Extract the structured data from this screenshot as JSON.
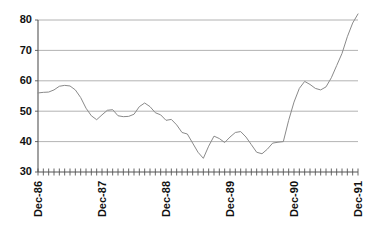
{
  "chart_data": {
    "type": "line",
    "title": "",
    "subtitle": "",
    "xlabel": "",
    "ylabel": "",
    "ylim": [
      30,
      80
    ],
    "xlim": [
      "Dec-86",
      "Dec-91"
    ],
    "grid": true,
    "legend": false,
    "legend_position": "none",
    "y_ticks": [
      30,
      40,
      50,
      60,
      70,
      80
    ],
    "y_tick_labels": [
      "30",
      "40",
      "50",
      "60",
      "70",
      "80"
    ],
    "x_tick_labels": [
      "Dec-86",
      "Dec-87",
      "Dec-88",
      "Dec-89",
      "Dec-90",
      "Dec-91"
    ],
    "x_tick_positions": [
      0,
      12,
      24,
      36,
      48,
      60
    ],
    "x_minor_tick_count": 61,
    "line_color": "#8a8a8a",
    "grid_color": "#a0a0a0",
    "axis_color": "#555555",
    "background_color": "#ffffff",
    "x": [
      "Dec-86",
      "Jan-87",
      "Feb-87",
      "Mar-87",
      "Apr-87",
      "May-87",
      "Jun-87",
      "Jul-87",
      "Aug-87",
      "Sep-87",
      "Oct-87",
      "Nov-87",
      "Dec-87",
      "Jan-88",
      "Feb-88",
      "Mar-88",
      "Apr-88",
      "May-88",
      "Jun-88",
      "Jul-88",
      "Aug-88",
      "Sep-88",
      "Oct-88",
      "Nov-88",
      "Dec-88",
      "Jan-89",
      "Feb-89",
      "Mar-89",
      "Apr-89",
      "May-89",
      "Jun-89",
      "Jul-89",
      "Aug-89",
      "Sep-89",
      "Oct-89",
      "Nov-89",
      "Dec-89",
      "Jan-90",
      "Feb-90",
      "Mar-90",
      "Apr-90",
      "May-90",
      "Jun-90",
      "Jul-90",
      "Aug-90",
      "Sep-90",
      "Oct-90",
      "Nov-90",
      "Dec-90",
      "Jan-91",
      "Feb-91",
      "Mar-91",
      "Apr-91",
      "May-91",
      "Jun-91",
      "Jul-91",
      "Aug-91",
      "Sep-91",
      "Oct-91",
      "Nov-91",
      "Dec-91"
    ],
    "series": [
      {
        "name": "series-1",
        "values": [
          56.0,
          56.2,
          56.3,
          57.0,
          58.2,
          58.5,
          58.3,
          57.0,
          54.5,
          51.0,
          48.5,
          47.2,
          48.8,
          50.3,
          50.5,
          48.5,
          48.2,
          48.3,
          49.0,
          51.5,
          52.7,
          51.5,
          49.5,
          48.8,
          47.0,
          47.3,
          45.5,
          43.0,
          42.5,
          39.5,
          36.5,
          34.5,
          38.5,
          41.8,
          41.0,
          39.7,
          41.5,
          43.0,
          43.3,
          41.5,
          39.0,
          36.5,
          36.0,
          37.5,
          39.5,
          39.8,
          40.0,
          47.0,
          53.0,
          57.5,
          59.8,
          58.8,
          57.5,
          57.0,
          58.0,
          61.0,
          65.0,
          69.0,
          74.5,
          79.0,
          82.0
        ]
      }
    ]
  },
  "axes": {
    "y_axis_name": "value-axis",
    "x_axis_name": "time-axis"
  }
}
